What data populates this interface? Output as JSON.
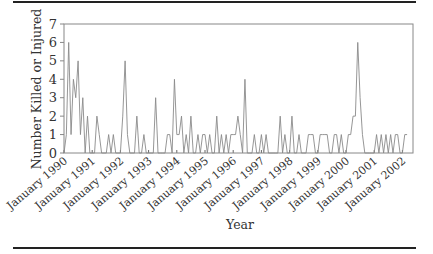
{
  "chart_data": {
    "type": "line",
    "title": "",
    "xlabel": "Year",
    "ylabel": "Number Killed or Injured",
    "ylim": [
      0,
      7
    ],
    "yticks": [
      0,
      1,
      2,
      3,
      4,
      5,
      6,
      7
    ],
    "grid": false,
    "legend": null,
    "xtick_labels": [
      "January 1990",
      "January 1991",
      "January 1992",
      "January 1993",
      "January 1994",
      "January 1995",
      "January 1996",
      "January 1997",
      "January 1998",
      "January 1999",
      "January 2000",
      "January 2001",
      "January 2002"
    ],
    "x_frequency": "monthly",
    "x_start": "1990-01",
    "series": [
      {
        "name": "Number Killed or Injured",
        "color": "#8a8a8a",
        "values": [
          0,
          1,
          6,
          1,
          4,
          3,
          5,
          1,
          3,
          0,
          2,
          0,
          0,
          0,
          2,
          1,
          0,
          0,
          0,
          1,
          0,
          1,
          0,
          0,
          0,
          2,
          5,
          1,
          0,
          0,
          0,
          2,
          0,
          0,
          1,
          0,
          0,
          0,
          0,
          3,
          0,
          0,
          0,
          0,
          1,
          1,
          0,
          4,
          1,
          1,
          2,
          0,
          1,
          0,
          2,
          0,
          0,
          1,
          0,
          1,
          1,
          0,
          1,
          0,
          0,
          2,
          0,
          1,
          0,
          1,
          0,
          1,
          1,
          1,
          2,
          1,
          0,
          4,
          0,
          0,
          0,
          1,
          0,
          0,
          1,
          0,
          1,
          0,
          0,
          0,
          0,
          0,
          2,
          0,
          1,
          0,
          0,
          2,
          0,
          0,
          1,
          0,
          0,
          0,
          1,
          1,
          1,
          0,
          0,
          1,
          1,
          1,
          1,
          0,
          0,
          1,
          1,
          0,
          1,
          0,
          0,
          1,
          1,
          2,
          2,
          6,
          3,
          1,
          0,
          0,
          0,
          0,
          0,
          1,
          0,
          1,
          0,
          1,
          0,
          1,
          0,
          1,
          1,
          0,
          0,
          1,
          1
        ]
      }
    ]
  }
}
